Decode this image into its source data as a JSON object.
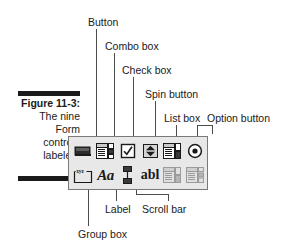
{
  "figure": {
    "caption_lines": [
      {
        "text": "Figure 11-3:",
        "bold": true
      },
      {
        "text": "The nine",
        "bold": false
      },
      {
        "text": "Form",
        "bold": false
      },
      {
        "text": "controls",
        "bold": false
      },
      {
        "text": "labeled.",
        "bold": false
      }
    ]
  },
  "callouts": {
    "button": "Button",
    "combo_box": "Combo box",
    "check_box": "Check box",
    "spin_button": "Spin button",
    "list_box": "List box",
    "option_button": "Option button",
    "label": "Label",
    "scroll_bar": "Scroll bar",
    "group_box": "Group box"
  },
  "toolbar": {
    "row1": [
      {
        "name": "button-control-icon",
        "label": "Button",
        "enabled": true
      },
      {
        "name": "combo-box-control-icon",
        "label": "Combo box",
        "enabled": true
      },
      {
        "name": "check-box-control-icon",
        "label": "Check box",
        "enabled": true
      },
      {
        "name": "spin-button-control-icon",
        "label": "Spin button",
        "enabled": true
      },
      {
        "name": "list-box-control-icon",
        "label": "List box",
        "enabled": true
      },
      {
        "name": "option-button-control-icon",
        "label": "Option button",
        "enabled": true
      }
    ],
    "row2": [
      {
        "name": "group-box-control-icon",
        "label": "Group box",
        "enabled": true,
        "glyph": "xyz"
      },
      {
        "name": "label-control-icon",
        "label": "Label",
        "enabled": true,
        "glyph": "Aa"
      },
      {
        "name": "scroll-bar-control-icon",
        "label": "Scroll bar",
        "enabled": true
      },
      {
        "name": "text-box-control-icon",
        "label": "Text box",
        "enabled": true,
        "glyph": "abl"
      },
      {
        "name": "grid-control-icon",
        "label": "Grid",
        "enabled": false
      },
      {
        "name": "table-control-icon",
        "label": "Table",
        "enabled": false
      }
    ]
  },
  "colors": {
    "ink": "#1a1a1a",
    "leader": "#4d4d4d",
    "toolbar_face": "#e8e8e8",
    "toolbar_border": "#7a7a7a",
    "disabled": "#9b9b9b",
    "page": "#ffffff"
  }
}
